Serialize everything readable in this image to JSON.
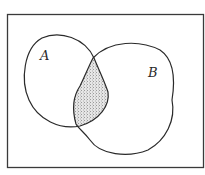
{
  "diagram": {
    "type": "venn",
    "universe": {
      "label": ""
    },
    "sets": [
      {
        "name": "A",
        "label": "A"
      },
      {
        "name": "B",
        "label": "B"
      }
    ],
    "shaded_region": "A ∩ B",
    "colors": {
      "stroke": "#2a2a2a",
      "shade": "#d4d4d4",
      "background": "#ffffff"
    }
  }
}
